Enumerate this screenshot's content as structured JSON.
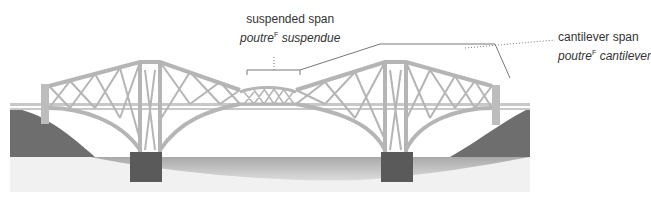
{
  "diagram": {
    "labels": [
      {
        "id": "suspended-span",
        "en": "suspended span",
        "fr_word": "poutre",
        "fr_gender": "F",
        "fr_rest": "suspendue"
      },
      {
        "id": "cantilever-span",
        "en": "cantilever span",
        "fr_word": "poutre",
        "fr_gender": "F",
        "fr_rest": "cantilever"
      }
    ]
  }
}
